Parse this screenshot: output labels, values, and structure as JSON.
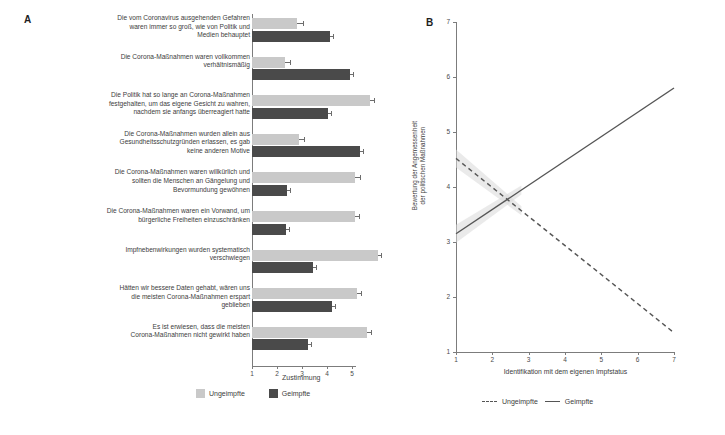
{
  "panel_a": {
    "letter": "A",
    "xlabel": "Zustimmung",
    "legend": [
      {
        "label": "Ungeimpfte",
        "swatch": "light"
      },
      {
        "label": "Geimpfte",
        "swatch": "dark"
      }
    ],
    "xticks": [
      "1",
      "2",
      "3",
      "4",
      "5"
    ]
  },
  "panel_b": {
    "letter": "B",
    "xlabel": "Identifikation mit dem eigenen Impfstatus",
    "ylabel": "Bewertung der Angemessenheit\nder politischen Maßnahmen",
    "xticks": [
      "1",
      "2",
      "3",
      "4",
      "5",
      "6",
      "7"
    ],
    "yticks": [
      "1",
      "2",
      "3",
      "4",
      "5",
      "6",
      "7"
    ],
    "legend": [
      {
        "label": "Ungeimpfte",
        "style": "dashed"
      },
      {
        "label": "Geimpfte",
        "style": "solid"
      }
    ]
  },
  "chart_data": [
    {
      "type": "bar",
      "orientation": "horizontal",
      "title": "A",
      "xlabel": "Zustimmung",
      "ylabel": "",
      "xlim": [
        1,
        5
      ],
      "grid": false,
      "legend_position": "bottom",
      "categories": [
        "Die vom Coronavirus ausgehenden Gefahren\nwaren immer so groß, wie von Politik und\nMedien behauptet",
        "Die Corona-Maßnahmen waren vollkommen\nverhältnismäßig",
        "Die Politik hat so lange an Corona-Maßnahmen\nfestgehalten, um das eigene Gesicht zu wahren,\nnachdem sie anfangs überreagiert hatte",
        "Die Corona-Maßnahmen wurden allein aus\nGesundheitsschutzgründen erlassen, es gab\nkeine anderen Motive",
        "Die Corona-Maßnahmen waren willkürlich und\nsollten die Menschen an Gängelung und\nBevormundung gewöhnen",
        "Die Corona-Maßnahmen waren ein Vorwand, um\nbürgerliche Freiheiten einzuschränken",
        "Impfnebenwirkungen wurden systematisch\nverschwiegen",
        "Hätten wir bessere Daten gehabt, wären uns\ndie meisten Corona-Maßnahmen erspart\ngeblieben",
        "Es ist erwiesen, dass die meisten\nCorona-Maßnahmen nicht gewirkt haben"
      ],
      "series": [
        {
          "name": "Ungeimpfte",
          "color": "#c9c9c9",
          "values": [
            2.8,
            2.32,
            5.72,
            2.88,
            5.12,
            5.1,
            6.02,
            5.18,
            5.58
          ],
          "errors": [
            0.22,
            0.18,
            0.16,
            0.2,
            0.18,
            0.18,
            0.14,
            0.18,
            0.16
          ]
        },
        {
          "name": "Geimpfte",
          "color": "#4a4a4a",
          "values": [
            4.1,
            4.92,
            4.02,
            5.3,
            2.38,
            2.34,
            3.42,
            4.18,
            3.22
          ],
          "errors": [
            0.14,
            0.12,
            0.12,
            0.12,
            0.12,
            0.12,
            0.12,
            0.12,
            0.12
          ]
        }
      ]
    },
    {
      "type": "line",
      "title": "B",
      "xlabel": "Identifikation mit dem eigenen Impfstatus",
      "ylabel": "Bewertung der Angemessenheit der politischen Maßnahmen",
      "xlim": [
        1,
        7
      ],
      "ylim": [
        1,
        7
      ],
      "grid": false,
      "legend_position": "bottom",
      "series": [
        {
          "name": "Ungeimpfte",
          "style": "dashed",
          "color": "#555555",
          "x": [
            1,
            7
          ],
          "y": [
            4.52,
            1.35
          ]
        },
        {
          "name": "Geimpfte",
          "style": "solid",
          "color": "#555555",
          "x": [
            1,
            7
          ],
          "y": [
            3.15,
            5.8
          ]
        }
      ]
    }
  ]
}
